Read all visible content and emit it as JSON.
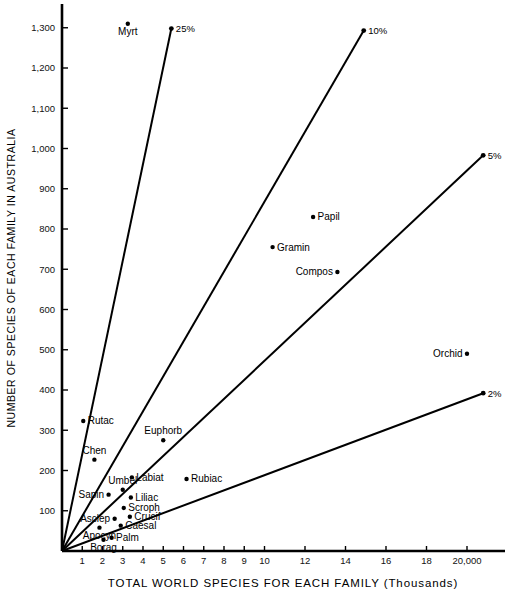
{
  "chart_data": {
    "type": "scatter",
    "title": "",
    "xlabel": "TOTAL WORLD SPECIES FOR EACH FAMILY (Thousands)",
    "ylabel": "NUMBER OF SPECIES OF EACH FAMILY IN AUSTRALIA",
    "xlim": [
      0,
      20
    ],
    "ylim": [
      0,
      1350
    ],
    "grid": false,
    "legend": "none",
    "x_tick_labels": [
      "1",
      "2",
      "3",
      "4",
      "5",
      "6",
      "7",
      "8",
      "9",
      "10",
      "12",
      "14",
      "16",
      "18",
      "20,000"
    ],
    "x_tick_values": [
      1,
      2,
      3,
      4,
      5,
      6,
      7,
      8,
      9,
      10,
      12,
      14,
      16,
      18,
      20
    ],
    "y_tick_labels": [
      "100",
      "200",
      "300",
      "400",
      "500",
      "600",
      "700",
      "800",
      "900",
      "1,000",
      "1,100",
      "1,200",
      "1,300"
    ],
    "y_tick_values": [
      100,
      200,
      300,
      400,
      500,
      600,
      700,
      800,
      900,
      1000,
      1100,
      1200,
      1300
    ],
    "points": [
      {
        "label": "Myrt",
        "x": 3.25,
        "y": 1310,
        "label_pos": "below"
      },
      {
        "label": "Papil",
        "x": 12.4,
        "y": 830,
        "label_pos": "right"
      },
      {
        "label": "Gramin",
        "x": 10.4,
        "y": 755,
        "label_pos": "right"
      },
      {
        "label": "Compos",
        "x": 13.6,
        "y": 693,
        "label_pos": "left"
      },
      {
        "label": "Orchid",
        "x": 20.0,
        "y": 490,
        "label_pos": "left"
      },
      {
        "label": "Euphorb",
        "x": 5.0,
        "y": 275,
        "label_pos": "above"
      },
      {
        "label": "Rutac",
        "x": 1.05,
        "y": 323,
        "label_pos": "right"
      },
      {
        "label": "Chen",
        "x": 1.6,
        "y": 227,
        "label_pos": "above"
      },
      {
        "label": "Rubiac",
        "x": 6.15,
        "y": 179,
        "label_pos": "right"
      },
      {
        "label": "Labiat",
        "x": 3.45,
        "y": 183,
        "label_pos": "right"
      },
      {
        "label": "Umbel",
        "x": 3.0,
        "y": 152,
        "label_pos": "above"
      },
      {
        "label": "Liliac",
        "x": 3.4,
        "y": 133,
        "label_pos": "right"
      },
      {
        "label": "Sapin",
        "x": 2.3,
        "y": 140,
        "label_pos": "left"
      },
      {
        "label": "Scroph",
        "x": 3.05,
        "y": 107,
        "label_pos": "right"
      },
      {
        "label": "Crucif",
        "x": 3.35,
        "y": 85,
        "label_pos": "right"
      },
      {
        "label": "Asclep",
        "x": 2.6,
        "y": 80,
        "label_pos": "left"
      },
      {
        "label": "Caesal",
        "x": 2.9,
        "y": 63,
        "label_pos": "right"
      },
      {
        "label": "Apocyn",
        "x": 1.85,
        "y": 58,
        "label_pos": "below"
      },
      {
        "label": "Palm",
        "x": 2.45,
        "y": 33,
        "label_pos": "right"
      },
      {
        "label": "Borag",
        "x": 2.05,
        "y": 28,
        "label_pos": "below"
      }
    ],
    "reference_lines": [
      {
        "label": "25%",
        "slope_percent": 25,
        "x_end": 5.4,
        "y_end": 1298
      },
      {
        "label": "10%",
        "slope_percent": 10,
        "x_end": 14.9,
        "y_end": 1293
      },
      {
        "label": "5%",
        "slope_percent": 5,
        "x_end": 20.8,
        "y_end": 983
      },
      {
        "label": "2%",
        "slope_percent": 2,
        "x_end": 20.8,
        "y_end": 392
      }
    ]
  },
  "axes": {
    "x_title": "TOTAL WORLD SPECIES FOR EACH FAMILY (Thousands)",
    "y_title": "NUMBER OF SPECIES OF EACH FAMILY IN AUSTRALIA"
  }
}
